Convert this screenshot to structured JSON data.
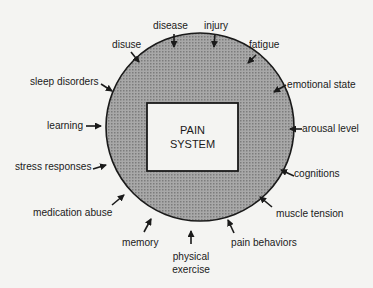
{
  "diagram": {
    "center_box": {
      "line1": "PAIN",
      "line2": "SYSTEM"
    },
    "colors": {
      "circle_fill": "#9a9a9a",
      "box_fill": "#f4f4f2",
      "stroke": "#1a1a1a",
      "background": "#f4f4f2"
    },
    "factors": [
      {
        "id": "disease",
        "label": "disease"
      },
      {
        "id": "injury",
        "label": "injury"
      },
      {
        "id": "fatigue",
        "label": "fatigue"
      },
      {
        "id": "emotional-state",
        "label": "emotional state"
      },
      {
        "id": "arousal-level",
        "label": "arousal level"
      },
      {
        "id": "cognitions",
        "label": "cognitions"
      },
      {
        "id": "muscle-tension",
        "label": "muscle tension"
      },
      {
        "id": "pain-behaviors",
        "label": "pain behaviors"
      },
      {
        "id": "physical-exercise",
        "label": "physical",
        "label2": "exercise"
      },
      {
        "id": "memory",
        "label": "memory"
      },
      {
        "id": "medication-abuse",
        "label": "medication abuse"
      },
      {
        "id": "stress-responses",
        "label": "stress responses"
      },
      {
        "id": "learning",
        "label": "learning"
      },
      {
        "id": "sleep-disorders",
        "label": "sleep disorders"
      },
      {
        "id": "disuse",
        "label": "disuse"
      }
    ]
  }
}
